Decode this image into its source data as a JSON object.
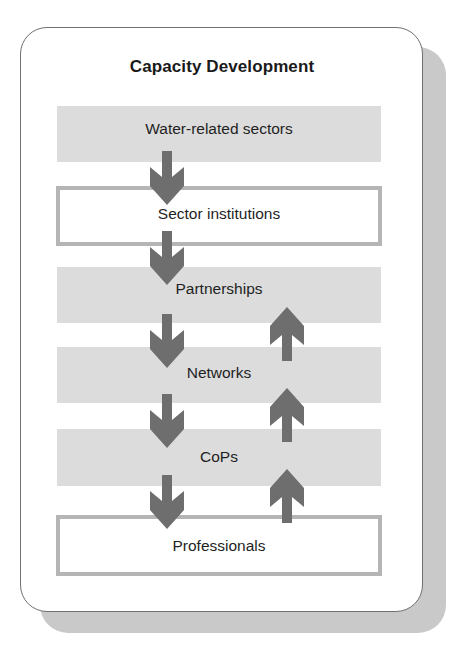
{
  "diagram": {
    "title": "Capacity Development",
    "levels": [
      {
        "label": "Water-related sectors",
        "style": "shaded-band"
      },
      {
        "label": "Sector institutions",
        "style": "outlined-box"
      },
      {
        "label": "Partnerships",
        "style": "shaded-band"
      },
      {
        "label": "Networks",
        "style": "shaded-band"
      },
      {
        "label": "CoPs",
        "style": "shaded-band"
      },
      {
        "label": "Professionals",
        "style": "outlined-box"
      }
    ],
    "flows": {
      "down": [
        {
          "from": "Water-related sectors",
          "to": "Sector institutions"
        },
        {
          "from": "Sector institutions",
          "to": "Partnerships"
        },
        {
          "from": "Partnerships",
          "to": "Networks"
        },
        {
          "from": "Networks",
          "to": "CoPs"
        },
        {
          "from": "CoPs",
          "to": "Professionals"
        }
      ],
      "up": [
        {
          "from": "Networks",
          "to": "Partnerships"
        },
        {
          "from": "CoPs",
          "to": "Networks"
        },
        {
          "from": "Professionals",
          "to": "CoPs"
        }
      ]
    },
    "colors": {
      "band": "#dcdcdc",
      "box_border": "#b5b5b5",
      "arrow": "#6e6e6e",
      "card_border": "#707070",
      "shadow": "#c9c9c9"
    }
  }
}
